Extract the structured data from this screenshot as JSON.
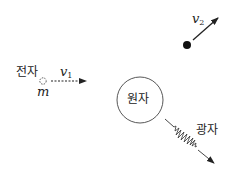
{
  "diagram": {
    "electron": {
      "label": "전자",
      "mass_symbol": "m",
      "velocity_symbol": "v",
      "velocity_subscript": "1"
    },
    "scattered_electron": {
      "velocity_symbol": "v",
      "velocity_subscript": "2"
    },
    "atom": {
      "label": "원자"
    },
    "photon": {
      "label": "광자"
    },
    "colors": {
      "line": "#222222",
      "background": "#ffffff"
    }
  }
}
